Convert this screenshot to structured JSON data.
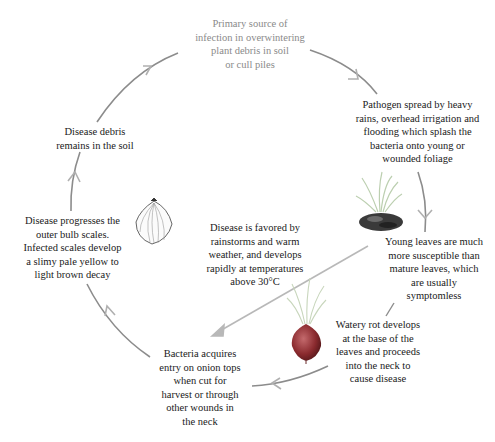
{
  "diagram": {
    "nodes": [
      {
        "id": "primary_source",
        "text": "Primary source of infection in overwintering plant debris in soil or cull piles",
        "lines": [
          "Primary source of",
          "infection in overwintering",
          "plant debris in soil",
          "or cull piles"
        ]
      },
      {
        "id": "pathogen_spread",
        "text": "Pathogen spread by heavy rains, overhead irrigation and flooding which splash the bacteria onto young or wounded foliage",
        "lines": [
          "Pathogen spread by heavy",
          "rains, overhead irrigation and",
          "flooding which splash the",
          "bacteria onto young or",
          "wounded foliage"
        ]
      },
      {
        "id": "young_leaves",
        "text": "Young leaves are much more susceptible than mature leaves, which are usually symptomless",
        "lines": [
          "Young leaves are much",
          "more susceptible than",
          "mature leaves, which",
          "are usually",
          "symptomless"
        ]
      },
      {
        "id": "watery_rot",
        "text": "Watery rot develops at the base of the leaves and proceeds into the neck to cause disease",
        "lines": [
          "Watery rot develops",
          "at the base of the",
          "leaves and proceeds",
          "into the neck to",
          "cause disease"
        ]
      },
      {
        "id": "bacteria_entry",
        "text": "Bacteria acquires entry on onion tops when cut for harvest or through other wounds in the neck",
        "lines": [
          "Bacteria acquires",
          "entry on onion tops",
          "when cut for",
          "harvest or through",
          "other wounds in",
          "the neck"
        ]
      },
      {
        "id": "disease_progresses",
        "text": "Disease progresses the outer bulb scales. Infected scales develop a slimy pale yellow to light brown decay",
        "lines": [
          "Disease progresses the",
          "outer bulb scales.",
          "Infected scales develop",
          "a slimy pale yellow to",
          "light brown decay"
        ]
      },
      {
        "id": "debris_remains",
        "text": "Disease debris remains in the soil",
        "lines": [
          "Disease debris",
          "remains in the soil"
        ]
      },
      {
        "id": "favored_by",
        "text": "Disease is favored by rainstorms and warm weather, and develops rapidly at temperatures above 30°C",
        "lines": [
          "Disease is favored by",
          "rainstorms and warm",
          "weather, and develops",
          "rapidly at temperatures",
          "above 30°C"
        ]
      }
    ],
    "illustrations": [
      {
        "id": "seedling",
        "icon": "seedling-in-soil-icon"
      },
      {
        "id": "infected_onion",
        "icon": "red-onion-bulb-icon"
      },
      {
        "id": "onion_bulb",
        "icon": "onion-bulb-sketch-icon"
      }
    ],
    "colors": {
      "arrow": "#8c8c8c",
      "arrow_light": "#b8b8b8",
      "text": "#1a1a1a",
      "text_muted": "#8a8a8a",
      "onion_red": "#8a2a2e",
      "leaf_green": "#b9cfa6"
    }
  }
}
